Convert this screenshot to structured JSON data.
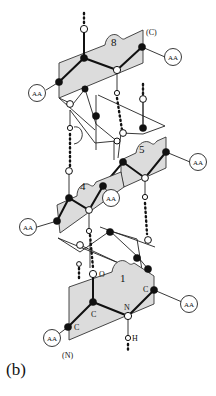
{
  "figure": {
    "caption": "(b)",
    "terminal_labels": {
      "c_terminus": "(C)",
      "n_terminus": "(N)"
    },
    "peptide_numbers": {
      "p8": "8",
      "p5": "5",
      "p4": "4",
      "p1": "1"
    },
    "side_chain_label": "AA",
    "atom_labels": {
      "carbon": "C",
      "nitrogen": "N",
      "oxygen": "O",
      "hydrogen": "H"
    },
    "legend_glyphs": {
      "alpha_carbon": "filled black circle",
      "nitrogen_or_oxygen": "open white circle",
      "hydrogen_bond": "dotted line",
      "peptide_plane": "shaded parallelogram"
    }
  }
}
